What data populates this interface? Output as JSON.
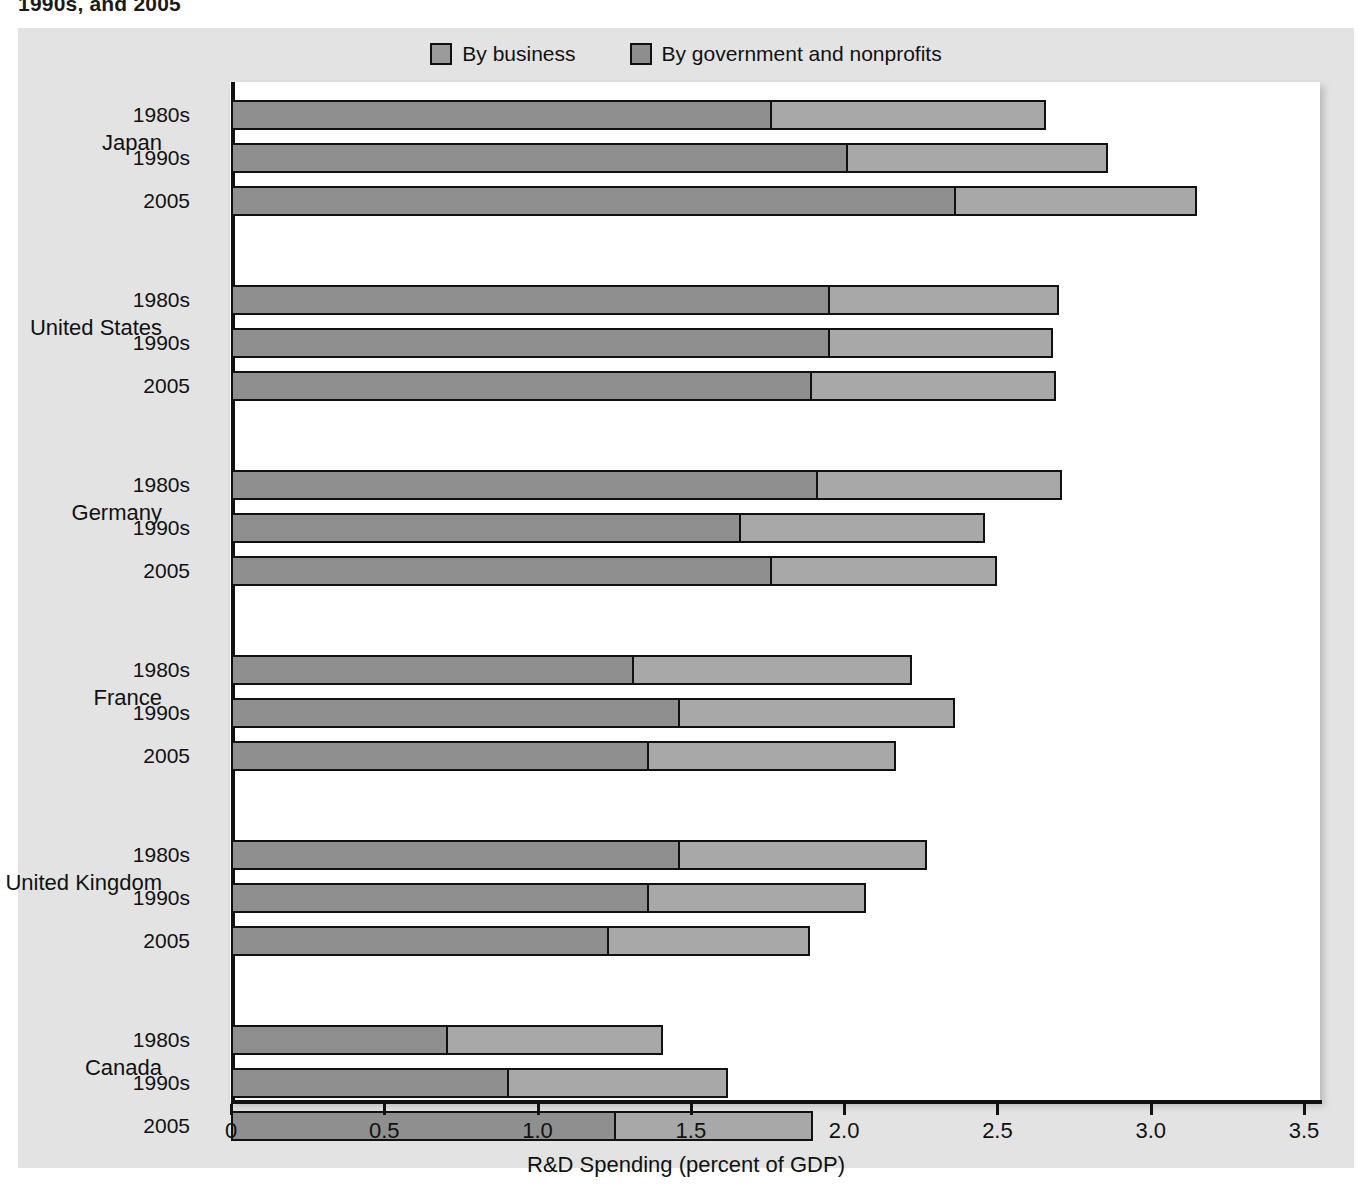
{
  "caption": {
    "cropped_line": "1990s, and 2005"
  },
  "legend": {
    "items": [
      {
        "label": "By business",
        "color": "#8f8f8f",
        "key": "business"
      },
      {
        "label": "By government and nonprofits",
        "color": "#a8a8a8",
        "key": "government"
      }
    ]
  },
  "axis": {
    "x_title": "R&D Spending (percent of GDP)",
    "ticks": [
      "0",
      "0.5",
      "1.0",
      "1.5",
      "2.0",
      "2.5",
      "3.0",
      "3.5"
    ],
    "tick_values": [
      0,
      0.5,
      1.0,
      1.5,
      2.0,
      2.5,
      3.0,
      3.5
    ],
    "min": 0,
    "max": 3.5
  },
  "chart_data": {
    "type": "bar",
    "orientation": "horizontal",
    "stacked": true,
    "title": "",
    "xlabel": "R&D Spending (percent of GDP)",
    "ylabel": "",
    "xlim": [
      0,
      3.5
    ],
    "grid": false,
    "legend_position": "top-center",
    "series": [
      {
        "name": "By business",
        "color": "#8f8f8f"
      },
      {
        "name": "By government and nonprofits",
        "color": "#a8a8a8"
      }
    ],
    "groups": [
      {
        "country": "Japan",
        "rows": [
          {
            "period": "1980s",
            "business": 1.76,
            "government": 0.9,
            "total": 2.66
          },
          {
            "period": "1990s",
            "business": 2.01,
            "government": 0.85,
            "total": 2.86
          },
          {
            "period": "2005",
            "business": 2.36,
            "government": 0.79,
            "total": 3.15
          }
        ]
      },
      {
        "country": "United States",
        "rows": [
          {
            "period": "1980s",
            "business": 1.95,
            "government": 0.75,
            "total": 2.7
          },
          {
            "period": "1990s",
            "business": 1.95,
            "government": 0.73,
            "total": 2.68
          },
          {
            "period": "2005",
            "business": 1.89,
            "government": 0.8,
            "total": 2.69
          }
        ]
      },
      {
        "country": "Germany",
        "rows": [
          {
            "period": "1980s",
            "business": 1.91,
            "government": 0.8,
            "total": 2.71
          },
          {
            "period": "1990s",
            "business": 1.66,
            "government": 0.8,
            "total": 2.46
          },
          {
            "period": "2005",
            "business": 1.76,
            "government": 0.74,
            "total": 2.5
          }
        ]
      },
      {
        "country": "France",
        "rows": [
          {
            "period": "1980s",
            "business": 1.31,
            "government": 0.91,
            "total": 2.22
          },
          {
            "period": "1990s",
            "business": 1.46,
            "government": 0.9,
            "total": 2.36
          },
          {
            "period": "2005",
            "business": 1.36,
            "government": 0.81,
            "total": 2.17
          }
        ]
      },
      {
        "country": "United Kingdom",
        "rows": [
          {
            "period": "1980s",
            "business": 1.46,
            "government": 0.81,
            "total": 2.27
          },
          {
            "period": "1990s",
            "business": 1.36,
            "government": 0.71,
            "total": 2.07
          },
          {
            "period": "2005",
            "business": 1.23,
            "government": 0.66,
            "total": 1.89
          }
        ]
      },
      {
        "country": "Canada",
        "rows": [
          {
            "period": "1980s",
            "business": 0.7,
            "government": 0.71,
            "total": 1.41
          },
          {
            "period": "1990s",
            "business": 0.9,
            "government": 0.72,
            "total": 1.62
          },
          {
            "period": "2005",
            "business": 1.25,
            "government": 0.65,
            "total": 1.9
          }
        ]
      },
      {
        "country": "Italy",
        "rows": [
          {
            "period": "1980s",
            "business": 0.63,
            "government": 0.41,
            "total": 1.04
          },
          {
            "period": "1990s",
            "business": 0.6,
            "government": 0.51,
            "total": 1.11
          },
          {
            "period": "2005",
            "business": 0.52,
            "government": 0.59,
            "total": 1.11
          }
        ]
      }
    ]
  }
}
